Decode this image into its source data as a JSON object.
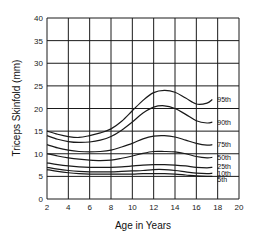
{
  "chart_data": {
    "type": "line",
    "title": "",
    "xlabel": "Age in Years",
    "ylabel": "Triceps Skinfold (mm)",
    "xlim": [
      2,
      20
    ],
    "ylim": [
      0,
      40
    ],
    "xticks": [
      2,
      4,
      6,
      8,
      10,
      12,
      14,
      16,
      18,
      20
    ],
    "yticks": [
      0,
      5,
      10,
      15,
      20,
      25,
      30,
      35,
      40
    ],
    "grid": true,
    "legend_position": "inline-right",
    "x": [
      2,
      3,
      4,
      5,
      6,
      7,
      8,
      9,
      10,
      11,
      12,
      13,
      14,
      15,
      16,
      17,
      17.5
    ],
    "series": [
      {
        "name": "95th",
        "values": [
          15,
          14.3,
          13.8,
          13.6,
          14,
          14.6,
          15.5,
          17.2,
          19.5,
          21.8,
          23.5,
          24,
          23.6,
          22.3,
          21,
          21.2,
          22
        ]
      },
      {
        "name": "90th",
        "values": [
          14,
          13.2,
          12.7,
          12.5,
          12.6,
          13,
          13.8,
          15.2,
          17,
          19,
          20.3,
          20.6,
          20,
          18.7,
          17.3,
          16.8,
          17
        ]
      },
      {
        "name": "75th",
        "values": [
          12,
          11.3,
          10.8,
          10.5,
          10.4,
          10.5,
          10.8,
          11.5,
          12.3,
          13.3,
          13.9,
          14,
          13.7,
          13,
          12.3,
          11.9,
          12
        ]
      },
      {
        "name": "50th",
        "values": [
          10,
          9.5,
          9.1,
          8.8,
          8.6,
          8.5,
          8.6,
          9,
          9.5,
          10.1,
          10.5,
          10.5,
          10.4,
          10,
          9.4,
          9.1,
          9.2
        ]
      },
      {
        "name": "25th",
        "values": [
          8,
          7.6,
          7.3,
          7.1,
          7,
          7,
          7,
          7.1,
          7.3,
          7.5,
          7.6,
          7.6,
          7.5,
          7.3,
          7,
          6.9,
          7
        ]
      },
      {
        "name": "10th",
        "values": [
          7,
          6.6,
          6.3,
          6.1,
          6,
          6,
          6,
          6.1,
          6.2,
          6.3,
          6.5,
          6.5,
          6.3,
          6,
          5.7,
          5.6,
          5.7
        ]
      },
      {
        "name": "5th",
        "values": [
          6.5,
          6.1,
          5.8,
          5.6,
          5.5,
          5.5,
          5.5,
          5.5,
          5.5,
          5.6,
          5.6,
          5.6,
          5.5,
          5.3,
          5.1,
          5,
          5
        ]
      }
    ],
    "line_color": "#1a1a1a",
    "grid_color": "#1a1a1a"
  }
}
